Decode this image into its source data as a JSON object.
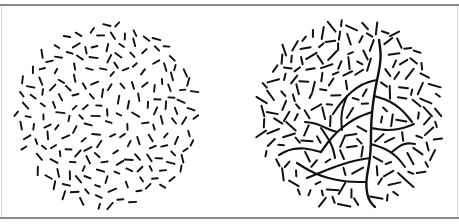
{
  "figure": {
    "width": 459,
    "height": 224,
    "background_color": "#ffffff",
    "element_color": "#111111",
    "rule_color": "#8a8a8a",
    "edge_color": "#d8d8d8",
    "description": "Two circular texture stimuli side by side: a random-orientation line-element field, and an equivalent field containing an embedded branching contour path."
  },
  "panels": [
    {
      "id": "left",
      "name": "random-field-panel",
      "label": "",
      "circle": {
        "cx": 107,
        "cy": 109,
        "r": 93
      },
      "element_count": 190,
      "has_contour": false,
      "contour_description": "none",
      "seed": 1729,
      "dash": {
        "length_min": 5.0,
        "length_max": 8.5,
        "thickness": 1.9,
        "orientation": "uniform-random"
      }
    },
    {
      "id": "right",
      "name": "contour-field-panel",
      "label": "",
      "circle": {
        "cx": 121,
        "cy": 109,
        "r": 94
      },
      "element_count": 170,
      "has_contour": true,
      "contour_description": "branching tree-like chains of aligned elements forming continuous curves",
      "seed": 8153,
      "dash": {
        "length_min": 5.0,
        "length_max": 13.0,
        "thickness": 2.0,
        "orientation": "mixed-random-and-aligned"
      },
      "contours": [
        {
          "name": "main-trunk",
          "width": 2.4,
          "points": [
            [
              150,
              34
            ],
            [
              152,
              46
            ],
            [
              151,
              60
            ],
            [
              148,
              74
            ],
            [
              145,
              90
            ],
            [
              143,
              106
            ],
            [
              142,
              122
            ],
            [
              142,
              138
            ],
            [
              141,
              152
            ],
            [
              139,
              164
            ],
            [
              137,
              176
            ],
            [
              138,
              188
            ],
            [
              141,
              196
            ],
            [
              146,
              201
            ]
          ]
        },
        {
          "name": "upper-left-branch",
          "width": 2.2,
          "points": [
            [
              148,
              74
            ],
            [
              138,
              76
            ],
            [
              127,
              82
            ],
            [
              118,
              90
            ],
            [
              110,
              99
            ],
            [
              104,
              108
            ]
          ]
        },
        {
          "name": "upper-left-branch-fork",
          "width": 2.0,
          "points": [
            [
              118,
              90
            ],
            [
              114,
              100
            ],
            [
              112,
              112
            ],
            [
              113,
              124
            ]
          ]
        },
        {
          "name": "mid-left-branch",
          "width": 2.2,
          "points": [
            [
              143,
              106
            ],
            [
              131,
              110
            ],
            [
              119,
              117
            ],
            [
              108,
              126
            ],
            [
              99,
              136
            ],
            [
              92,
              146
            ]
          ]
        },
        {
          "name": "mid-left-branch-fork",
          "width": 2.0,
          "points": [
            [
              108,
              126
            ],
            [
              101,
              124
            ],
            [
              93,
              120
            ],
            [
              85,
              117
            ],
            [
              76,
              116
            ]
          ]
        },
        {
          "name": "lower-left-branch",
          "width": 2.2,
          "points": [
            [
              141,
              152
            ],
            [
              128,
              154
            ],
            [
              114,
              158
            ],
            [
              100,
              163
            ],
            [
              88,
              168
            ],
            [
              78,
              172
            ]
          ]
        },
        {
          "name": "lower-left-long-branch",
          "width": 2.2,
          "points": [
            [
              137,
              176
            ],
            [
              122,
              176
            ],
            [
              107,
              174
            ],
            [
              92,
              170
            ],
            [
              79,
              164
            ],
            [
              68,
              157
            ]
          ]
        },
        {
          "name": "left-arc-branch",
          "width": 2.1,
          "points": [
            [
              92,
              146
            ],
            [
              81,
              143
            ],
            [
              70,
              142
            ],
            [
              59,
              144
            ],
            [
              50,
              149
            ]
          ]
        },
        {
          "name": "chevron-branch",
          "width": 2.1,
          "points": [
            [
              92,
              122
            ],
            [
              99,
              132
            ],
            [
              104,
              142
            ],
            [
              106,
              152
            ]
          ]
        },
        {
          "name": "right-upper-branch",
          "width": 2.2,
          "points": [
            [
              145,
              90
            ],
            [
              156,
              93
            ],
            [
              167,
              99
            ],
            [
              176,
              107
            ],
            [
              183,
              116
            ]
          ]
        },
        {
          "name": "right-mid-branch",
          "width": 2.1,
          "points": [
            [
              142,
              122
            ],
            [
              153,
              124
            ],
            [
              164,
              124
            ],
            [
              175,
              122
            ],
            [
              185,
              118
            ]
          ]
        },
        {
          "name": "right-lower-branch",
          "width": 2.0,
          "points": [
            [
              142,
              138
            ],
            [
              152,
              141
            ],
            [
              162,
              146
            ],
            [
              170,
              153
            ],
            [
              176,
              161
            ]
          ]
        },
        {
          "name": "right-hook-branch",
          "width": 2.0,
          "points": [
            [
              163,
              146
            ],
            [
              170,
              140
            ],
            [
              178,
              137
            ],
            [
              186,
              138
            ]
          ]
        }
      ]
    }
  ],
  "rules": [
    {
      "name": "top-rule",
      "y": 4,
      "thickness": 2,
      "color": "#8a8a8a"
    },
    {
      "name": "bottom-rule",
      "y": 217,
      "thickness": 2,
      "color": "#8a8a8a"
    }
  ]
}
